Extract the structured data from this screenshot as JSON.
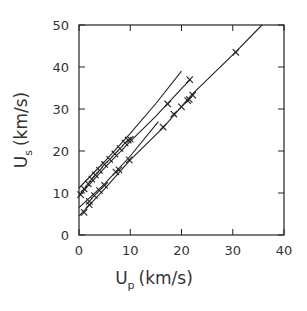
{
  "chart_data": {
    "type": "line",
    "title": "",
    "xlabel": "U_p (km/s)",
    "ylabel": "U_s (km/s)",
    "xlabel_parts": {
      "main": "U",
      "sub": "p",
      "unit": "(km/s)"
    },
    "ylabel_parts": {
      "main": "U",
      "sub": "s",
      "unit": "(km/s)"
    },
    "xlim": [
      0,
      40
    ],
    "ylim": [
      0,
      50
    ],
    "xticks": [
      "0",
      "10",
      "20",
      "30",
      "40"
    ],
    "yticks": [
      "0",
      "10",
      "20",
      "30",
      "40",
      "50"
    ],
    "grid": false,
    "legend": "none",
    "series": [
      {
        "name": "fit-1",
        "line": [
          [
            0,
            11.2
          ],
          [
            5,
            17.5
          ],
          [
            10,
            24.2
          ],
          [
            15,
            31.3
          ],
          [
            20,
            39.0
          ]
        ],
        "points": [
          [
            0.3,
            9.6
          ],
          [
            1.0,
            11.0
          ],
          [
            1.8,
            12.2
          ],
          [
            2.5,
            13.3
          ],
          [
            3.2,
            14.3
          ],
          [
            4.0,
            15.4
          ],
          [
            5.0,
            16.8
          ],
          [
            6.0,
            18.0
          ],
          [
            7.0,
            19.3
          ],
          [
            8.0,
            20.6
          ],
          [
            9.0,
            21.9
          ],
          [
            9.6,
            22.6
          ]
        ]
      },
      {
        "name": "fit-2",
        "line": [
          [
            0,
            9.3
          ],
          [
            5,
            16.0
          ],
          [
            10,
            22.3
          ],
          [
            15,
            28.3
          ],
          [
            21.8,
            37.2
          ]
        ],
        "points": [
          [
            10.0,
            22.8
          ],
          [
            17.3,
            31.2
          ],
          [
            21.6,
            37.0
          ]
        ]
      },
      {
        "name": "fit-3",
        "line": [
          [
            0,
            6.5
          ],
          [
            5,
            12.2
          ],
          [
            10,
            18.8
          ],
          [
            15.5,
            27.0
          ]
        ],
        "points": [
          [
            2.0,
            8.0
          ],
          [
            3.0,
            9.4
          ],
          [
            4.0,
            10.6
          ],
          [
            5.0,
            11.8
          ],
          [
            7.2,
            15.0
          ],
          [
            7.8,
            15.5
          ]
        ]
      },
      {
        "name": "fit-4",
        "line": [
          [
            0,
            4.5
          ],
          [
            5,
            11.0
          ],
          [
            10,
            17.9
          ],
          [
            16.5,
            25.7
          ],
          [
            22,
            33.4
          ],
          [
            30.5,
            43.5
          ],
          [
            35.7,
            50.0
          ]
        ],
        "points": [
          [
            1.0,
            5.4
          ],
          [
            2.0,
            7.2
          ],
          [
            9.8,
            17.9
          ],
          [
            16.4,
            25.7
          ],
          [
            18.5,
            28.8
          ],
          [
            20.0,
            30.5
          ],
          [
            21.2,
            32.0
          ],
          [
            21.5,
            32.3
          ],
          [
            22.2,
            33.3
          ],
          [
            30.6,
            43.5
          ]
        ]
      }
    ]
  }
}
